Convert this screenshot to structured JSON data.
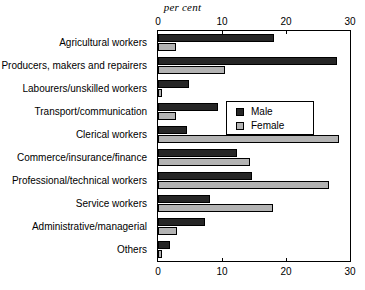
{
  "chart_data": {
    "type": "bar",
    "orientation": "horizontal",
    "title": "per cent",
    "xlabel": "",
    "ylabel": "",
    "xlim": [
      0,
      30
    ],
    "xticks": [
      0,
      10,
      20,
      30
    ],
    "xtick_labels": [
      "0",
      "10",
      "20",
      "30"
    ],
    "grid": false,
    "legend_position": "middle-right-inside",
    "categories": [
      "Agricultural workers",
      "Producers, makers and repairers",
      "Labourers/unskilled workers",
      "Transport/communication",
      "Clerical workers",
      "Commerce/insurance/finance",
      "Professional/technical workers",
      "Service workers",
      "Administrative/managerial",
      "Others"
    ],
    "series": [
      {
        "name": "Male",
        "color": "#262626",
        "values": [
          18.1,
          28.0,
          4.8,
          9.4,
          4.6,
          12.4,
          14.7,
          8.1,
          7.4,
          1.8
        ]
      },
      {
        "name": "Female",
        "color": "#b3b3b3",
        "values": [
          2.8,
          10.4,
          0.7,
          2.8,
          28.3,
          14.3,
          26.7,
          18.0,
          2.9,
          0.6
        ]
      }
    ]
  },
  "axis": {
    "top_ticks": [
      "0",
      "10",
      "20",
      "30"
    ],
    "bottom_ticks": [
      "0",
      "10",
      "20",
      "30"
    ]
  },
  "legend": {
    "items": [
      {
        "label": "Male"
      },
      {
        "label": "Female"
      }
    ]
  }
}
